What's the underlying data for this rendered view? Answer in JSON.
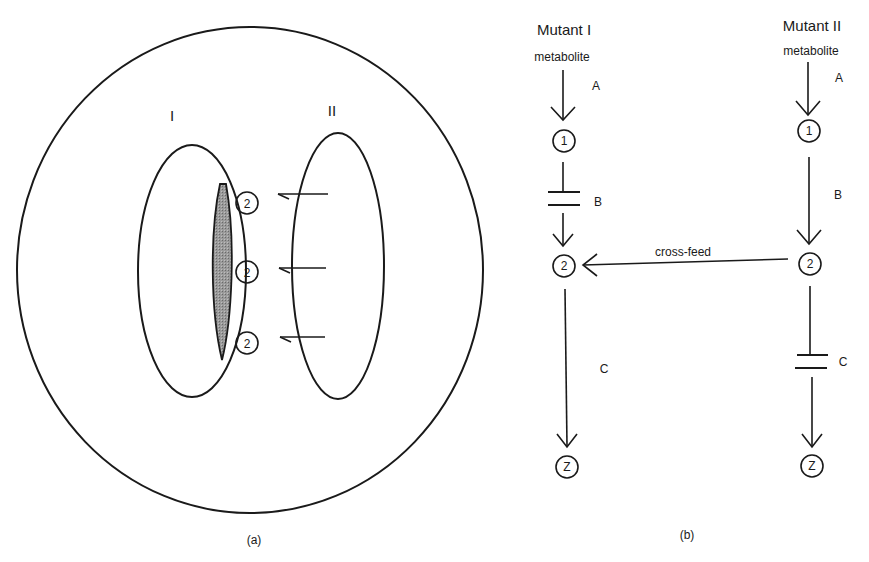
{
  "panel_a": {
    "caption": "(a)",
    "cell_labels": {
      "left": "I",
      "right": "II"
    },
    "diffusing_molecule": "2",
    "molecule_count": 3,
    "shaded_color": "#8a8a8a"
  },
  "panel_b": {
    "caption": "(b)",
    "mutant_left": {
      "title": "Mutant I",
      "source": "metabolite",
      "steps": [
        "A",
        "B",
        "C"
      ],
      "blocked_step": "B",
      "nodes": [
        "1",
        "2",
        "Z"
      ]
    },
    "mutant_right": {
      "title": "Mutant II",
      "source": "metabolite",
      "steps": [
        "A",
        "B",
        "C"
      ],
      "blocked_step": "C",
      "nodes": [
        "1",
        "2",
        "Z"
      ]
    },
    "cross_feed_label": "cross-feed"
  }
}
